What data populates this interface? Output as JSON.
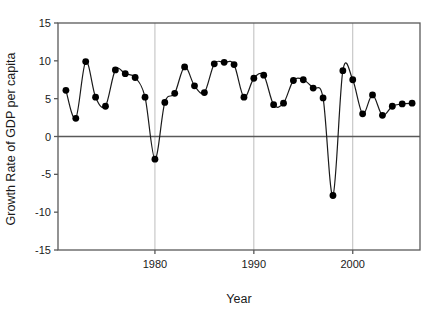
{
  "chart_data": {
    "type": "line",
    "title": "",
    "subtitle": "",
    "xlabel": "Year",
    "ylabel": "Growth Rate of GDP per capita",
    "xlim": [
      1970.2,
      2006.8
    ],
    "ylim": [
      -15,
      15
    ],
    "xticks": [
      1980,
      1990,
      2000
    ],
    "xtick_labels": [
      "1980",
      "1990",
      "2000"
    ],
    "yticks": [
      -15,
      -10,
      -5,
      0,
      5,
      10,
      15
    ],
    "ytick_labels": [
      "-15",
      "-10",
      "-5",
      "0",
      "5",
      "10",
      "15"
    ],
    "grid": "vertical-only-at-xticks",
    "legend": "none",
    "marker": "filled-circle",
    "marker_color": "#000000",
    "line_color": "#1a1a1a",
    "zero_line": 0,
    "series": [
      {
        "name": "Growth Rate of GDP per capita",
        "x": [
          1971,
          1972,
          1973,
          1974,
          1975,
          1976,
          1977,
          1978,
          1979,
          1980,
          1981,
          1982,
          1983,
          1984,
          1985,
          1986,
          1987,
          1988,
          1989,
          1990,
          1991,
          1992,
          1993,
          1994,
          1995,
          1996,
          1997,
          1998,
          1999,
          2000,
          2001,
          2002,
          2003,
          2004,
          2005,
          2006
        ],
        "y": [
          6.1,
          2.4,
          9.9,
          5.2,
          4.0,
          8.8,
          8.3,
          7.8,
          5.2,
          -3.0,
          4.5,
          5.7,
          9.2,
          6.7,
          5.8,
          9.6,
          9.8,
          9.5,
          5.2,
          7.7,
          8.1,
          4.2,
          4.4,
          7.4,
          7.5,
          6.4,
          5.1,
          -7.8,
          8.7,
          7.5,
          3.0,
          5.5,
          2.8,
          4.0,
          4.3,
          4.4
        ]
      }
    ]
  },
  "axes": {
    "y_title": "Growth Rate of GDP per capita",
    "x_title": "Year"
  }
}
